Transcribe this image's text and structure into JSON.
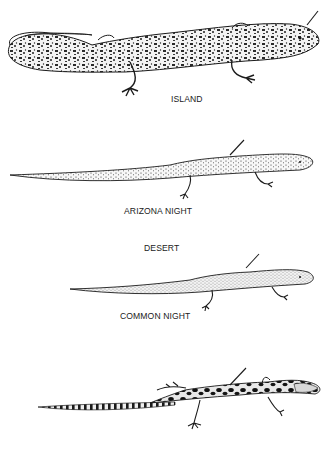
{
  "figure": {
    "type": "scientific illustration of lizards (night lizards)",
    "background": "#ffffff",
    "ink": "#1b1b1b",
    "lizards": [
      {
        "id": "island",
        "label": "ISLAND",
        "pattern": "dense mottled spots, curled tail",
        "label_pos": {
          "x": 165,
          "y": 93
        }
      },
      {
        "id": "arizona-night",
        "label": "ARIZONA NIGHT",
        "pattern": "fine speckles, long thin tail",
        "label_pos": {
          "x": 121,
          "y": 205
        }
      },
      {
        "id": "common-night",
        "label": "COMMON NIGHT",
        "pattern": "fine stippling",
        "label_pos": {
          "x": 120,
          "y": 311
        }
      },
      {
        "id": "bottom-unlabeled",
        "label": "",
        "pattern": "bold dark blotches, banded tail"
      }
    ],
    "group_heading": {
      "label": "DESERT",
      "pos": {
        "x": 142,
        "y": 242
      }
    }
  }
}
